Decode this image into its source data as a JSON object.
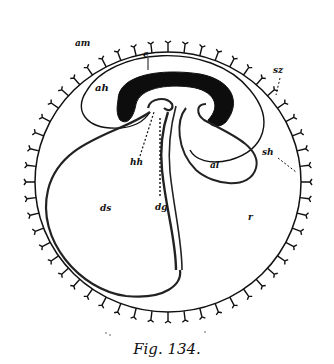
{
  "figure": {
    "caption": "Fig. 134.",
    "labels": {
      "am": "am",
      "e": "e",
      "sz": "sz",
      "ah": "ah",
      "hh": "hh",
      "al": "al",
      "sh": "sh",
      "ds": "ds",
      "dg": "dg",
      "r": "r"
    },
    "colors": {
      "ink": "#111111",
      "background": "#ffffff"
    }
  }
}
